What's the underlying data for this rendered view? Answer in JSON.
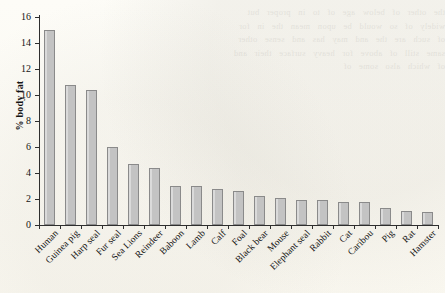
{
  "chart_data": {
    "type": "bar",
    "title": "",
    "xlabel": "",
    "ylabel": "% body fat",
    "ylim": [
      0,
      16
    ],
    "yticks": [
      0,
      2,
      4,
      6,
      8,
      10,
      12,
      14,
      16
    ],
    "grid": false,
    "legend": null,
    "categories": [
      "Human",
      "Guinea pig",
      "Harp seal",
      "Fur seal",
      "Sea Lions",
      "Reindeer",
      "Baboon",
      "Lamb",
      "Calf",
      "Foal",
      "Black bear",
      "Mouse",
      "Elephant seal",
      "Rabbit",
      "Cat",
      "Caribou",
      "Pig",
      "Rat",
      "Hamster"
    ],
    "values": [
      15.0,
      10.8,
      10.4,
      6.0,
      4.7,
      4.4,
      3.0,
      3.0,
      2.8,
      2.6,
      2.2,
      2.05,
      1.95,
      1.95,
      1.8,
      1.8,
      1.3,
      1.1,
      1.0
    ],
    "bar_color": "#c3c3c3",
    "bar_edge_color": "#8a8a8a",
    "axis_color": "#2e2e2e"
  },
  "showthrough_text": "the other of below age of to in proper but widely of so would be upon mean the in for of such are the and may has and sense other same still of above for heavy surface their and of which also some of"
}
